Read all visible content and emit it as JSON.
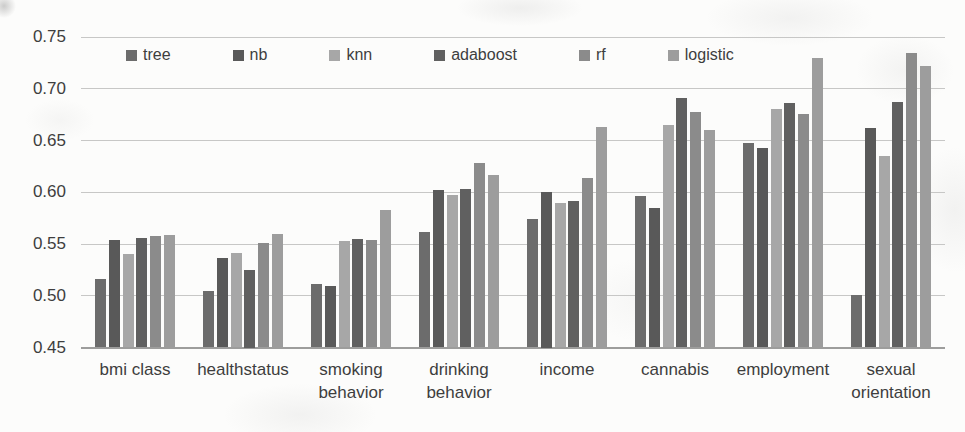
{
  "chart_data": {
    "type": "bar",
    "title": "",
    "xlabel": "",
    "ylabel": "",
    "ylim": [
      0.45,
      0.75
    ],
    "ytick_step": 0.05,
    "ytick_labels": [
      "0.75",
      "0.70",
      "0.65",
      "0.60",
      "0.55",
      "0.50",
      "0.45"
    ],
    "grid": "horizontal",
    "legend_position": "top-inside",
    "categories": [
      "bmi class",
      "healthstatus",
      "smoking behavior",
      "drinking behavior",
      "income",
      "cannabis",
      "employment",
      "sexual orientation"
    ],
    "series": [
      {
        "name": "tree",
        "color": "#6c6c6c",
        "values": [
          0.516,
          0.505,
          0.511,
          0.562,
          0.574,
          0.596,
          0.648,
          0.501
        ]
      },
      {
        "name": "nb",
        "color": "#595959",
        "values": [
          0.554,
          0.536,
          0.509,
          0.602,
          0.6,
          0.585,
          0.643,
          0.662
        ]
      },
      {
        "name": "knn",
        "color": "#a7a7a7",
        "values": [
          0.54,
          0.541,
          0.553,
          0.597,
          0.59,
          0.665,
          0.68,
          0.635
        ]
      },
      {
        "name": "adaboost",
        "color": "#606060",
        "values": [
          0.556,
          0.525,
          0.555,
          0.603,
          0.592,
          0.691,
          0.686,
          0.687
        ]
      },
      {
        "name": "rf",
        "color": "#8b8b8b",
        "values": [
          0.558,
          0.551,
          0.554,
          0.628,
          0.614,
          0.678,
          0.676,
          0.735
        ]
      },
      {
        "name": "logistic",
        "color": "#9d9d9d",
        "values": [
          0.559,
          0.56,
          0.583,
          0.617,
          0.663,
          0.66,
          0.73,
          0.722
        ]
      }
    ]
  },
  "colors": {
    "background": "#fcfcfb",
    "gridline": "#c7c7c6",
    "axisline": "#9d9d9c",
    "text": "#3e3e3e"
  }
}
